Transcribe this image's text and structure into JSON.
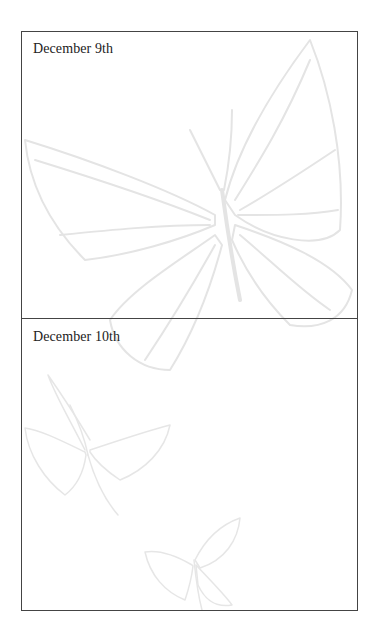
{
  "page": {
    "entries": [
      {
        "label": "December 9th"
      },
      {
        "label": "December 10th"
      }
    ],
    "decoration": {
      "motif": "butterfly-watermark",
      "color": "#e6e6e6"
    },
    "colors": {
      "border": "#444444",
      "text": "#222222",
      "background": "#ffffff"
    }
  }
}
